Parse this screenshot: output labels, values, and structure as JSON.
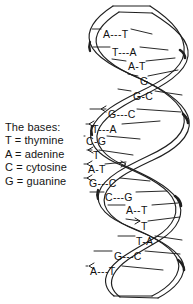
{
  "figure": {
    "ink_color": "#1a1a1a",
    "background_color": "#ffffff"
  },
  "legend": {
    "heading": "The bases:",
    "entries": [
      "T = thymine",
      "A = adenine",
      "C = cytosine",
      "G = guanine"
    ]
  },
  "helix": {
    "base_pairs": [
      {
        "label": "A---T",
        "x": 103,
        "y": 29
      },
      {
        "label": "T---A",
        "x": 112,
        "y": 47
      },
      {
        "label": "A-T",
        "x": 128,
        "y": 61
      },
      {
        "label": "G",
        "x": 140,
        "y": 76
      },
      {
        "label": "G-C",
        "x": 133,
        "y": 91
      },
      {
        "label": "G---C",
        "x": 108,
        "y": 109
      },
      {
        "label": "T---A",
        "x": 92,
        "y": 124
      },
      {
        "label": "C-G",
        "x": 86,
        "y": 136
      },
      {
        "label": "T",
        "x": 93,
        "y": 150
      },
      {
        "label": "A-T",
        "x": 88,
        "y": 164
      },
      {
        "label": "G---C",
        "x": 89,
        "y": 178
      },
      {
        "label": "C---G",
        "x": 105,
        "y": 192
      },
      {
        "label": "A--T",
        "x": 126,
        "y": 205
      },
      {
        "label": "T",
        "x": 141,
        "y": 221
      },
      {
        "label": "T-A",
        "x": 136,
        "y": 236
      },
      {
        "label": "G---C",
        "x": 114,
        "y": 251
      },
      {
        "label": "A---T",
        "x": 90,
        "y": 266
      }
    ]
  }
}
